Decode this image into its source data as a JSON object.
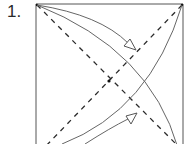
{
  "diagram": {
    "type": "origami-folding-step",
    "step_label": "1.",
    "colors": {
      "line": "#3a3a3a",
      "curve": "#6a6a6a",
      "background": "#ffffff"
    },
    "elements": [
      {
        "name": "paper-square",
        "description": "square sheet outline (bottom cropped)"
      },
      {
        "name": "valley-fold-diagonal-1",
        "description": "dashed diagonal from top-left to bottom-right"
      },
      {
        "name": "valley-fold-diagonal-2",
        "description": "dashed diagonal from top-right to bottom-left"
      },
      {
        "name": "center-point",
        "description": "dot where diagonals cross"
      },
      {
        "name": "fold-arrow-top",
        "description": "curved arrow from top-left corner toward center, hollow arrowhead"
      },
      {
        "name": "fold-arrow-bottom",
        "description": "curved arrow from bottom-left toward center, hollow arrowhead"
      },
      {
        "name": "corner-arc-top-left",
        "description": "arc from top-left corner to bottom-right"
      },
      {
        "name": "corner-arc-bottom-left",
        "description": "arc from bottom-left to top-right corner"
      }
    ]
  }
}
